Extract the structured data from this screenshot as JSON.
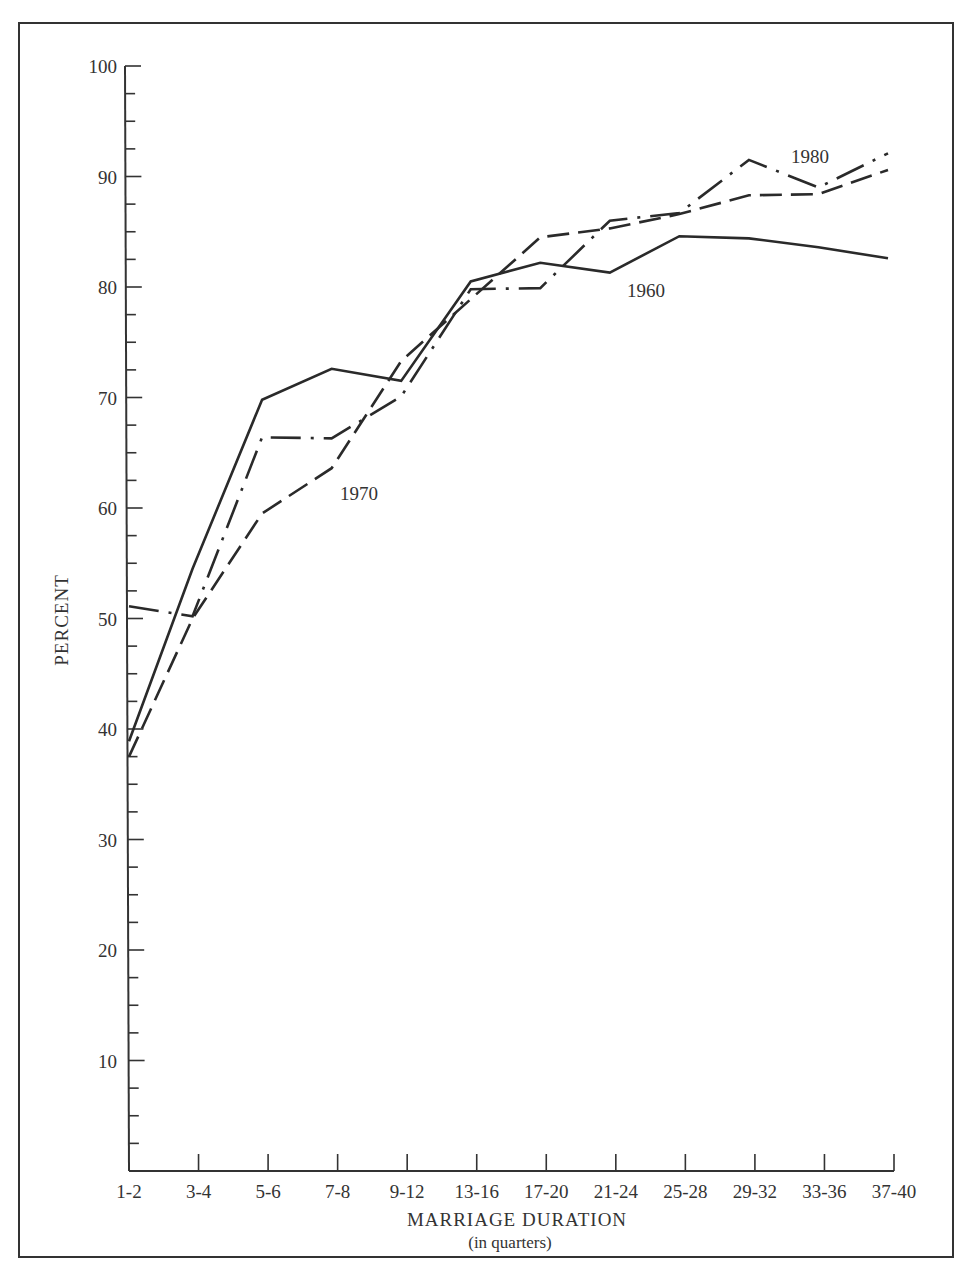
{
  "chart_data": {
    "type": "line",
    "title": "",
    "xlabel": "MARRIAGE DURATION",
    "xlabel_sub": "(in quarters)",
    "ylabel": "PERCENT",
    "ylim": [
      0,
      100
    ],
    "yticks": [
      10,
      20,
      30,
      40,
      50,
      60,
      70,
      80,
      90,
      100
    ],
    "y_minor_step": 2.5,
    "grid": false,
    "legend": "inline labels",
    "categories": [
      "1-2",
      "3-4",
      "5-6",
      "7-8",
      "9-12",
      "13-16",
      "17-20",
      "21-24",
      "25-28",
      "29-32",
      "33-36",
      "37-40"
    ],
    "series": [
      {
        "name": "1960",
        "style": "solid",
        "values": [
          38.9,
          54.5,
          69.8,
          72.6,
          71.5,
          80.5,
          82.2,
          81.3,
          84.6,
          84.4,
          83.6,
          82.6
        ],
        "label_pos": {
          "x": 627,
          "y": 297
        }
      },
      {
        "name": "1970",
        "style": "dashed",
        "values": [
          37.5,
          50.0,
          59.5,
          63.6,
          73.3,
          78.9,
          84.5,
          85.3,
          86.6,
          88.3,
          88.4,
          90.6
        ],
        "label_pos": {
          "x": 340,
          "y": 500
        }
      },
      {
        "name": "1980",
        "style": "dash-dot",
        "values": [
          51.1,
          50.2,
          66.4,
          66.3,
          70.1,
          79.8,
          79.9,
          86.0,
          86.7,
          91.5,
          89.0,
          92.1
        ],
        "label_pos": {
          "x": 791,
          "y": 163
        }
      }
    ]
  },
  "chart": {
    "ylabel": "PERCENT",
    "xlabel": "MARRIAGE DURATION",
    "xlabel_sub": "(in quarters)"
  }
}
